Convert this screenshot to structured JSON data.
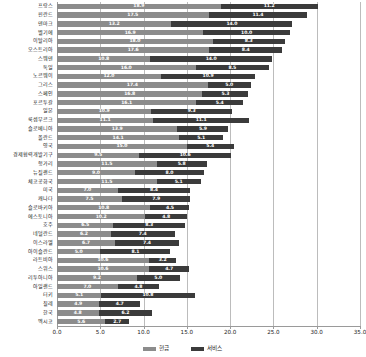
{
  "chart_data": {
    "type": "bar",
    "orientation": "horizontal",
    "stacked": true,
    "title": "",
    "xlabel": "",
    "ylabel": "",
    "xlim": [
      0.0,
      35.0
    ],
    "xticks": [
      "0.0",
      "5.0",
      "10.0",
      "15.0",
      "20.0",
      "25.0",
      "30.0",
      "35.0"
    ],
    "xtick_values": [
      0.0,
      5.0,
      10.0,
      15.0,
      20.0,
      25.0,
      30.0,
      35.0
    ],
    "grid": true,
    "legend_position": "bottom",
    "legend": [
      "현금",
      "서비스"
    ],
    "series": [
      {
        "name": "현금",
        "color": "#8c8c8c"
      },
      {
        "name": "서비스",
        "color": "#3b3b3b"
      }
    ],
    "categories": [
      "프랑스",
      "핀란드",
      "덴마크",
      "벨기에",
      "이탈리아",
      "오스트리아",
      "스웨덴",
      "독일",
      "노르웨이",
      "그리스",
      "스페인",
      "포르투갈",
      "일본",
      "룩셈부르크",
      "슬로베니아",
      "폴란드",
      "영국",
      "경제협력개발기구",
      "헝가리",
      "뉴질랜드",
      "체코공화국",
      "미국",
      "캐나다",
      "슬로바키아",
      "에스토니아",
      "호주",
      "네덜란드",
      "이스라엘",
      "아이슬란드",
      "라트비아",
      "스위스",
      "리투아니아",
      "아일랜드",
      "터키",
      "칠레",
      "한국",
      "멕시코"
    ],
    "rows": [
      {
        "category": "프랑스",
        "cash": 18.9,
        "service": 11.2,
        "total": 30.1
      },
      {
        "category": "핀란드",
        "cash": 17.5,
        "service": 11.4,
        "total": 28.9
      },
      {
        "category": "덴마크",
        "cash": 13.2,
        "service": 14.0,
        "total": 27.2
      },
      {
        "category": "벨기에",
        "cash": 16.9,
        "service": 10.0,
        "total": 26.9
      },
      {
        "category": "이탈리아",
        "cash": 18.0,
        "service": 8.3,
        "total": 26.3
      },
      {
        "category": "오스트리아",
        "cash": 17.6,
        "service": 8.4,
        "total": 26.0
      },
      {
        "category": "스웨덴",
        "cash": 10.8,
        "service": 14.0,
        "total": 24.8
      },
      {
        "category": "독일",
        "cash": 16.0,
        "service": 8.5,
        "total": 24.5
      },
      {
        "category": "노르웨이",
        "cash": 12.0,
        "service": 10.9,
        "total": 22.9
      },
      {
        "category": "그리스",
        "cash": 17.4,
        "service": 5.0,
        "total": 22.4
      },
      {
        "category": "스페인",
        "cash": 16.8,
        "service": 5.3,
        "total": 22.1
      },
      {
        "category": "포르투갈",
        "cash": 16.1,
        "service": 5.4,
        "total": 21.5
      },
      {
        "category": "일본",
        "cash": 10.9,
        "service": 9.3,
        "total": 20.2
      },
      {
        "category": "룩셈부르크",
        "cash": 11.1,
        "service": 11.1,
        "total": 22.2
      },
      {
        "category": "슬로베니아",
        "cash": 13.9,
        "service": 5.9,
        "total": 19.8
      },
      {
        "category": "폴란드",
        "cash": 14.1,
        "service": 5.1,
        "total": 19.2
      },
      {
        "category": "영국",
        "cash": 15.0,
        "service": 5.4,
        "total": 20.4
      },
      {
        "category": "경제협력개발기구",
        "cash": 9.5,
        "service": 10.6,
        "total": 20.1
      },
      {
        "category": "헝가리",
        "cash": 11.5,
        "service": 5.8,
        "total": 17.3
      },
      {
        "category": "뉴질랜드",
        "cash": 9.0,
        "service": 8.0,
        "total": 17.0
      },
      {
        "category": "체코공화국",
        "cash": 11.5,
        "service": 5.1,
        "total": 16.6
      },
      {
        "category": "미국",
        "cash": 7.0,
        "service": 8.4,
        "total": 15.4
      },
      {
        "category": "캐나다",
        "cash": 7.5,
        "service": 7.9,
        "total": 15.4
      },
      {
        "category": "슬로바키아",
        "cash": 10.8,
        "service": 4.5,
        "total": 15.3
      },
      {
        "category": "에스토니아",
        "cash": 10.2,
        "service": 4.8,
        "total": 15.0
      },
      {
        "category": "호주",
        "cash": 6.5,
        "service": 8.3,
        "total": 14.8
      },
      {
        "category": "네덜란드",
        "cash": 6.2,
        "service": 7.4,
        "total": 13.6
      },
      {
        "category": "이스라엘",
        "cash": 6.7,
        "service": 7.4,
        "total": 14.1
      },
      {
        "category": "아이슬란드",
        "cash": 5.0,
        "service": 8.1,
        "total": 13.1
      },
      {
        "category": "라트비아",
        "cash": 10.6,
        "service": 3.2,
        "total": 13.8
      },
      {
        "category": "스위스",
        "cash": 10.6,
        "service": 4.7,
        "total": 15.3
      },
      {
        "category": "리투아니아",
        "cash": 9.2,
        "service": 5.0,
        "total": 14.2
      },
      {
        "category": "아일랜드",
        "cash": 7.0,
        "service": 4.8,
        "total": 11.8
      },
      {
        "category": "터키",
        "cash": 5.1,
        "service": 10.8,
        "total": 15.9
      },
      {
        "category": "칠레",
        "cash": 4.9,
        "service": 4.7,
        "total": 9.6
      },
      {
        "category": "한국",
        "cash": 4.8,
        "service": 6.2,
        "total": 11.0
      },
      {
        "category": "멕시코",
        "cash": 5.6,
        "service": 2.7,
        "total": 8.3
      }
    ]
  }
}
